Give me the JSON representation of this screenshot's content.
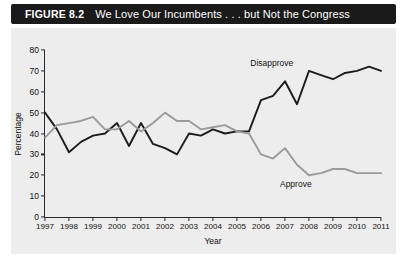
{
  "figure": {
    "number": "FIGURE 8.2",
    "title": "We Love Our Incumbents . . . but Not the Congress"
  },
  "colors": {
    "title_bar_background": "#1a1a1a",
    "title_bar_text": "#ffffff",
    "plot_background": "#ededed",
    "axis": "#2b2b2b",
    "disapprove_line": "#1c1c1c",
    "approve_line": "#9a9a9a"
  },
  "chart_data": {
    "type": "line",
    "title": "We Love Our Incumbents . . . but Not the Congress",
    "xlabel": "Year",
    "ylabel": "Percentage",
    "xlim": [
      1997,
      2011
    ],
    "ylim": [
      0,
      80
    ],
    "ytick_values": [
      0,
      10,
      20,
      30,
      40,
      50,
      60,
      70,
      80
    ],
    "xtick_values": [
      1997,
      1998,
      1999,
      2000,
      2001,
      2002,
      2003,
      2004,
      2005,
      2006,
      2007,
      2008,
      2009,
      2010,
      2011
    ],
    "grid": false,
    "legend": "inline-annotations",
    "annotations": [
      {
        "label": "Disapprove",
        "x": 2006.45,
        "y": 74
      },
      {
        "label": "Approve",
        "x": 2007.45,
        "y": 16
      }
    ],
    "series": [
      {
        "name": "Disapprove",
        "color": "#1c1c1c",
        "x": [
          1997.0,
          1997.5,
          1998.0,
          1998.5,
          1999.0,
          1999.5,
          2000.0,
          2000.5,
          2001.0,
          2001.5,
          2002.0,
          2002.5,
          2003.0,
          2003.5,
          2004.0,
          2004.5,
          2005.0,
          2005.5,
          2006.0,
          2006.5,
          2007.0,
          2007.5,
          2008.0,
          2008.5,
          2009.0,
          2009.5,
          2010.0,
          2010.5,
          2011.0
        ],
        "values": [
          50,
          42,
          31,
          36,
          39,
          40,
          45,
          34,
          45,
          35,
          33,
          30,
          40,
          39,
          42,
          40,
          41,
          41,
          56,
          58,
          65,
          54,
          70,
          68,
          66,
          69,
          70,
          72,
          70
        ]
      },
      {
        "name": "Approve",
        "color": "#9a9a9a",
        "x": [
          1997.0,
          1997.5,
          1998.0,
          1998.5,
          1999.0,
          1999.5,
          2000.0,
          2000.5,
          2001.0,
          2001.5,
          2002.0,
          2002.5,
          2003.0,
          2003.5,
          2004.0,
          2004.5,
          2005.0,
          2005.5,
          2006.0,
          2006.5,
          2007.0,
          2007.5,
          2008.0,
          2008.5,
          2009.0,
          2009.5,
          2010.0,
          2010.5,
          2011.0
        ],
        "values": [
          38,
          44,
          45,
          46,
          48,
          42,
          42,
          46,
          41,
          45,
          50,
          46,
          46,
          42,
          43,
          44,
          41,
          40,
          30,
          28,
          33,
          25,
          20,
          21,
          23,
          23,
          21,
          21,
          21
        ]
      }
    ]
  }
}
